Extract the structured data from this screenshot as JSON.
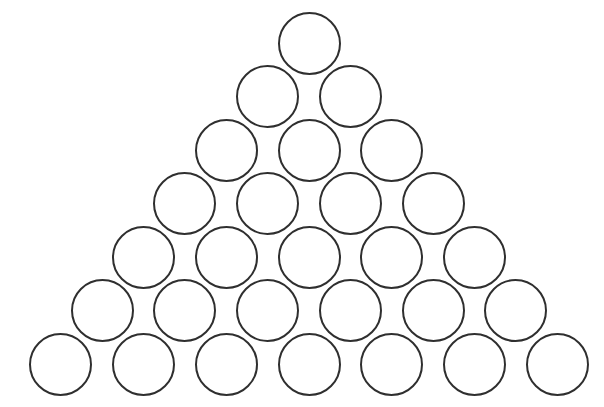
{
  "diagram": {
    "type": "triangular-circle-arrangement",
    "rows": 7,
    "circles_per_row": [
      1,
      2,
      3,
      4,
      5,
      6,
      7
    ],
    "total_circles": 28,
    "stroke_color": "#2f2f2f",
    "fill_color": "#ffffff",
    "background_color": "#ffffff",
    "circle_radius_px": 31.5,
    "horizontal_spacing_px": 82.7,
    "vertical_spacing_px": 53.5,
    "apex_center": [
      309,
      43
    ],
    "bottom_row_y": 364,
    "bottom_row_x_start": 59
  }
}
